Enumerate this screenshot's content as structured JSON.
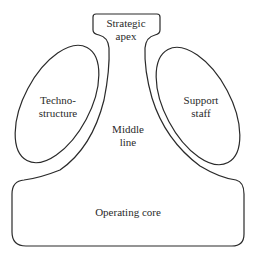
{
  "diagram": {
    "parts": {
      "strategic_apex": "Strategic\napex",
      "technostructure": "Techno-\nstructure",
      "support_staff": "Support\nstaff",
      "middle_line": "Middle\nline",
      "operating_core": "Operating core"
    },
    "stroke_color": "#2a2a2a",
    "background": "#ffffff"
  }
}
